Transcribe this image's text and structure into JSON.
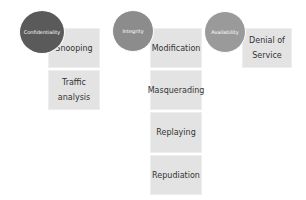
{
  "colors": {
    "confidentiality": "#5a5a5a",
    "integrity": "#8c8c8c",
    "availability": "#9a9a9a",
    "box": "#e3e3e3"
  },
  "groups": [
    {
      "label": "Confidentiality",
      "attacks": [
        "Snooping",
        "Traffic analysis"
      ]
    },
    {
      "label": "Integrity",
      "attacks": [
        "Modification",
        "Masquerading",
        "Replaying",
        "Repudiation"
      ]
    },
    {
      "label": "Availability",
      "attacks": [
        "Denial of Service"
      ]
    }
  ]
}
